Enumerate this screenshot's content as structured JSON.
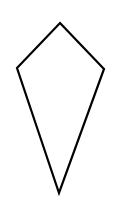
{
  "diagram": {
    "shape": "kite",
    "background_color": "#ffffff",
    "stroke_color": "#000000",
    "fill_color": "none",
    "stroke_width": 2.2,
    "vertices": [
      {
        "name": "top",
        "x": 60,
        "y": 23
      },
      {
        "name": "right",
        "x": 104,
        "y": 69
      },
      {
        "name": "bottom",
        "x": 59,
        "y": 193
      },
      {
        "name": "left",
        "x": 17,
        "y": 68
      }
    ]
  }
}
